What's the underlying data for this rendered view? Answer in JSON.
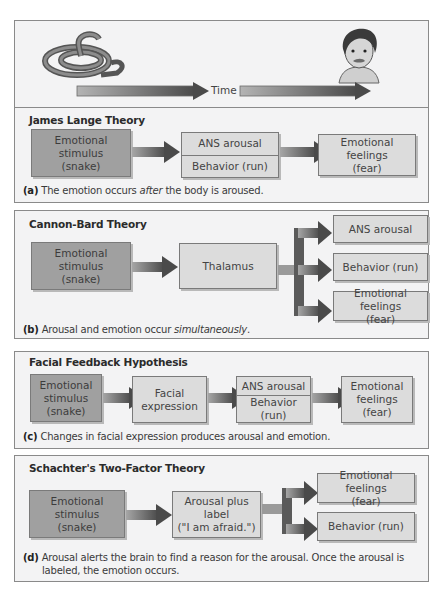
{
  "timeline": {
    "label": "Time",
    "start_image": "snake-illustration",
    "end_image": "frightened-man-face-illustration"
  },
  "panels": [
    {
      "title": "James Lange Theory",
      "boxes": {
        "stimulus": [
          "Emotional",
          "stimulus",
          "(snake)"
        ],
        "middle_top": "ANS arousal",
        "middle_bottom": "Behavior (run)",
        "result": [
          "Emotional feelings",
          "(fear)"
        ]
      },
      "caption_letter": "(a)",
      "caption_pre": "The emotion occurs ",
      "caption_em": "after",
      "caption_post": " the body is aroused."
    },
    {
      "title": "Cannon-Bard Theory",
      "boxes": {
        "stimulus": [
          "Emotional",
          "stimulus",
          "(snake)"
        ],
        "middle": "Thalamus",
        "out1": "ANS arousal",
        "out2": "Behavior (run)",
        "out3": [
          "Emotional feelings",
          "(fear)"
        ]
      },
      "caption_letter": "(b)",
      "caption_pre": "Arousal and emotion occur ",
      "caption_em": "simultaneously",
      "caption_post": "."
    },
    {
      "title": "Facial Feedback Hypothesis",
      "boxes": {
        "stimulus": [
          "Emotional",
          "stimulus",
          "(snake)"
        ],
        "face": [
          "Facial",
          "expression"
        ],
        "middle_top": "ANS arousal",
        "middle_bottom": "Behavior (run)",
        "result": [
          "Emotional",
          "feelings",
          "(fear)"
        ]
      },
      "caption_letter": "(c)",
      "caption_text": "Changes in facial expression produces arousal and emotion."
    },
    {
      "title": "Schachter's Two-Factor Theory",
      "boxes": {
        "stimulus": [
          "Emotional",
          "stimulus",
          "(snake)"
        ],
        "middle": [
          "Arousal plus label",
          "(\"I am afraid.\")"
        ],
        "out1": [
          "Emotional feelings",
          "(fear)"
        ],
        "out2": "Behavior (run)"
      },
      "caption_letter": "(d)",
      "caption_line1": "Arousal alerts the brain to find a reason for the arousal. Once the arousal is",
      "caption_line2": "labeled, the emotion occurs."
    }
  ],
  "colors": {
    "panel_bg": "#f3f3f4",
    "stimulus_box": "#a0a0a0",
    "light_box": "#dcdcdc",
    "arrow_dark": "#4a4a4a",
    "arrow_light": "#9a9a9a"
  }
}
